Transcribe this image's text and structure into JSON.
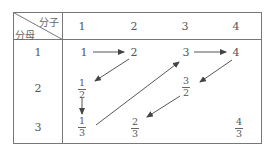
{
  "table": {
    "corner": {
      "top_label": "分子",
      "bottom_label": "分母"
    },
    "column_headers": [
      "1",
      "2",
      "3",
      "4"
    ],
    "row_headers": [
      "1",
      "2",
      "3"
    ],
    "cells": [
      [
        {
          "type": "int",
          "text": "1"
        },
        {
          "type": "int",
          "text": "2"
        },
        {
          "type": "int",
          "text": "3"
        },
        {
          "type": "int",
          "text": "4"
        }
      ],
      [
        {
          "type": "frac",
          "num": "1",
          "den": "2"
        },
        null,
        {
          "type": "frac",
          "num": "3",
          "den": "2"
        },
        null
      ],
      [
        {
          "type": "frac",
          "num": "1",
          "den": "3"
        },
        {
          "type": "frac",
          "num": "2",
          "den": "3"
        },
        null,
        {
          "type": "frac",
          "num": "4",
          "den": "3"
        }
      ]
    ]
  },
  "arrows": [
    {
      "from": "1",
      "to": "2",
      "direction": "right"
    },
    {
      "from": "2",
      "to": "1/2",
      "direction": "down-left"
    },
    {
      "from": "1/2",
      "to": "1/3",
      "direction": "down"
    },
    {
      "from": "1/3",
      "to": "3",
      "direction": "up-right"
    },
    {
      "from": "3",
      "to": "4",
      "direction": "right"
    },
    {
      "from": "4",
      "to": "3/2",
      "direction": "down-left"
    },
    {
      "from": "3/2",
      "to": "2/3",
      "direction": "down-left"
    }
  ],
  "colors": {
    "line": "#666666",
    "text": "#555555",
    "background": "#ffffff"
  }
}
